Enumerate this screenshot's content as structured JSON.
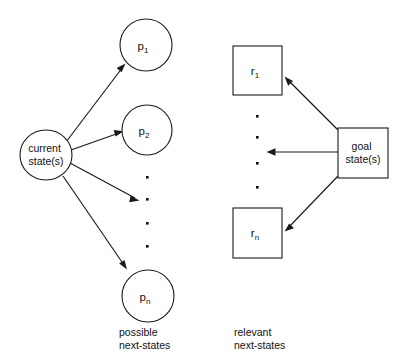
{
  "figure": {
    "width": 404,
    "height": 361,
    "background": "#ffffff",
    "ink_color": "#1a1a1a",
    "text_color": "#111111"
  },
  "left_panel": {
    "source": {
      "line1": "current",
      "line2": "state(s)",
      "shape": "ellipse"
    },
    "targets": [
      {
        "base": "p",
        "subscript": "1",
        "shape": "circle"
      },
      {
        "base": "p",
        "subscript": "2",
        "shape": "circle"
      },
      {
        "base": "p",
        "subscript": "n",
        "shape": "circle"
      }
    ],
    "ellipsis_dots": 4,
    "arrow_count": 4,
    "caption": {
      "line1": "possible",
      "line2": "next-states"
    }
  },
  "right_panel": {
    "source": {
      "line1": "goal",
      "line2": "state(s)",
      "shape": "square"
    },
    "targets": [
      {
        "base": "r",
        "subscript": "1",
        "shape": "square"
      },
      {
        "base": "r",
        "subscript": "n",
        "shape": "square"
      }
    ],
    "ellipsis_dots": 4,
    "arrow_count": 3,
    "caption": {
      "line1": "relevant",
      "line2": "next-states"
    }
  }
}
